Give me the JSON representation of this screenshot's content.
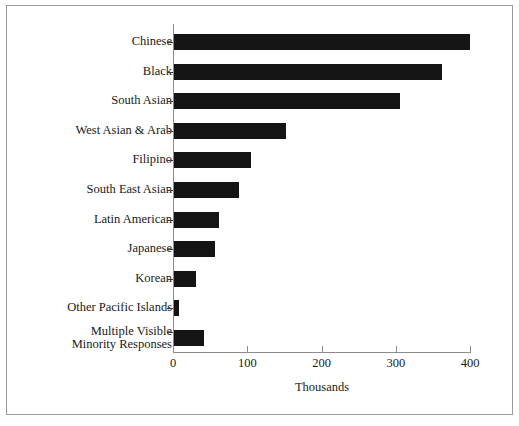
{
  "chart_data": {
    "type": "bar",
    "orientation": "horizontal",
    "title": "",
    "xlabel": "Thousands",
    "ylabel": "",
    "xlim": [
      0,
      400
    ],
    "xticks": [
      0,
      100,
      200,
      300,
      400
    ],
    "xtick_labels": [
      "0",
      "100",
      "200",
      "300",
      "400"
    ],
    "grid": false,
    "legend": false,
    "bar_color": "#141414",
    "axis_color": "#8c8c8c",
    "categories": [
      "Chinese",
      "Black",
      "South Asian",
      "West Asian & Arab",
      "Filipino",
      "South East Asian",
      "Latin American",
      "Japanese",
      "Korean",
      "Other Pacific Islands",
      "Multiple Visible Minority Responses"
    ],
    "category_lines": [
      [
        "Chinese"
      ],
      [
        "Black"
      ],
      [
        "South Asian"
      ],
      [
        "West Asian & Arab"
      ],
      [
        "Filipino"
      ],
      [
        "South East Asian"
      ],
      [
        "Latin American"
      ],
      [
        "Japanese"
      ],
      [
        "Korean"
      ],
      [
        "Other Pacific Islands"
      ],
      [
        "Multiple Visible",
        "Minority Responses"
      ]
    ],
    "values": [
      398,
      361,
      304,
      151,
      104,
      88,
      61,
      55,
      30,
      7,
      41
    ],
    "units": "thousands"
  }
}
